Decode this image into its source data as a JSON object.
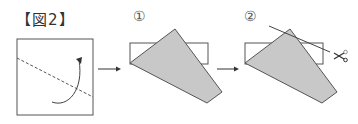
{
  "figure": {
    "title": "【図2】",
    "steps": [
      {
        "label": "①"
      },
      {
        "label": "②"
      }
    ],
    "colors": {
      "line": "#555555",
      "fill": "#c8c8c8",
      "dashed": "#555555"
    }
  }
}
